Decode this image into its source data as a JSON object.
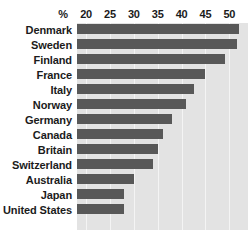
{
  "chart_data": {
    "type": "bar",
    "orientation": "horizontal",
    "title": "",
    "subtitle": "",
    "xlabel": "%",
    "ylabel": "",
    "unit_symbol": "%",
    "categories": [
      "Denmark",
      "Sweden",
      "Finland",
      "France",
      "Italy",
      "Norway",
      "Germany",
      "Canada",
      "Britain",
      "Switzerland",
      "Australia",
      "Japan",
      "United States"
    ],
    "values": [
      52,
      51.5,
      49,
      45,
      42.5,
      41,
      38,
      36,
      35,
      34,
      30,
      28,
      27.9
    ],
    "xlim": [
      18.1,
      53.9
    ],
    "xticks": [
      20,
      25,
      30,
      35,
      40,
      45,
      50
    ],
    "xtick_labels": [
      "20",
      "25",
      "30",
      "35",
      "40",
      "45",
      "50"
    ],
    "grid": true,
    "grid_axis": "x",
    "legend": false,
    "legend_position": "none",
    "colors": {
      "bar": "#585858",
      "plot_background": "#e3e3e3",
      "gridline": "#f4f4f4",
      "text": "#1b1b1b",
      "page_background": "#ffffff"
    }
  }
}
